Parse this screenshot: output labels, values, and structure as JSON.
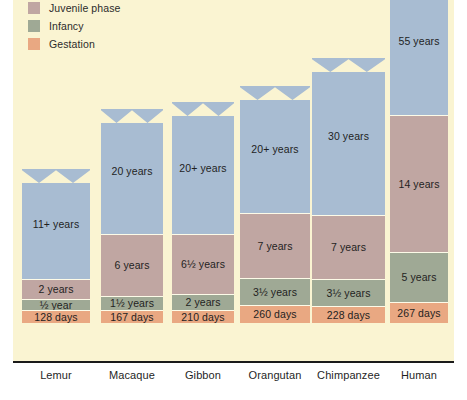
{
  "legend": {
    "items": [
      {
        "label": "Juvenile phase",
        "color": "#c0a6a2",
        "key": "juvenile"
      },
      {
        "label": "Infancy",
        "color": "#9fa995",
        "key": "infancy"
      },
      {
        "label": "Gestation",
        "color": "#e9a882",
        "key": "gestation"
      }
    ]
  },
  "colors": {
    "adult": "#a8bcd2",
    "juvenile": "#c0a6a2",
    "infancy": "#9fa995",
    "gestation": "#e9a882",
    "background": "#faf4d2",
    "axis": "#1a1a1a"
  },
  "chart_data": {
    "type": "bar",
    "title": "",
    "subtitle": "",
    "xlabel": "",
    "ylabel": "",
    "stacked": true,
    "grid": false,
    "legend_position": "top-left",
    "categories": [
      "Lemur",
      "Macaque",
      "Gibbon",
      "Orangutan",
      "Chimpanzee",
      "Human"
    ],
    "series": [
      {
        "name": "Gestation",
        "key": "gestation",
        "unit": "days",
        "values": [
          128,
          167,
          210,
          260,
          228,
          267
        ],
        "labels": [
          "128 days",
          "167 days",
          "210 days",
          "260 days",
          "228 days",
          "267 days"
        ]
      },
      {
        "name": "Infancy",
        "key": "infancy",
        "unit": "years",
        "values": [
          0.5,
          1.5,
          2,
          3.5,
          3.5,
          5
        ],
        "labels": [
          "½ year",
          "1½ years",
          "2 years",
          "3½ years",
          "3½ years",
          "5 years"
        ]
      },
      {
        "name": "Juvenile phase",
        "key": "juvenile",
        "unit": "years",
        "values": [
          2,
          6,
          6.5,
          7,
          7,
          14
        ],
        "labels": [
          "2 years",
          "6 years",
          "6½ years",
          "7 years",
          "7 years",
          "14 years"
        ]
      },
      {
        "name": "Adult phase",
        "key": "adult",
        "unit": "years",
        "values": [
          11,
          20,
          20,
          20,
          30,
          55
        ],
        "labels": [
          "11+ years",
          "20 years",
          "20+ years",
          "20+ years",
          "30 years",
          "55 years"
        ],
        "open_ended": [
          true,
          true,
          true,
          true,
          true,
          true
        ]
      }
    ]
  },
  "bars": [
    {
      "category": "Lemur",
      "segments": [
        {
          "key": "adult",
          "label": "11+ years",
          "jagged_top": true
        },
        {
          "key": "juvenile",
          "label": "2 years",
          "jagged_top": false
        },
        {
          "key": "infancy",
          "label": "½ year",
          "jagged_top": false
        },
        {
          "key": "gestation",
          "label": "128 days",
          "jagged_top": false
        }
      ]
    },
    {
      "category": "Macaque",
      "segments": [
        {
          "key": "adult",
          "label": "20 years",
          "jagged_top": true
        },
        {
          "key": "juvenile",
          "label": "6 years",
          "jagged_top": false
        },
        {
          "key": "infancy",
          "label": "1½ years",
          "jagged_top": false
        },
        {
          "key": "gestation",
          "label": "167 days",
          "jagged_top": false
        }
      ]
    },
    {
      "category": "Gibbon",
      "segments": [
        {
          "key": "adult",
          "label": "20+ years",
          "jagged_top": true
        },
        {
          "key": "juvenile",
          "label": "6½ years",
          "jagged_top": false
        },
        {
          "key": "infancy",
          "label": "2 years",
          "jagged_top": false
        },
        {
          "key": "gestation",
          "label": "210 days",
          "jagged_top": false
        }
      ]
    },
    {
      "category": "Orangutan",
      "segments": [
        {
          "key": "adult",
          "label": "20+ years",
          "jagged_top": true
        },
        {
          "key": "juvenile",
          "label": "7 years",
          "jagged_top": false
        },
        {
          "key": "infancy",
          "label": "3½ years",
          "jagged_top": false
        },
        {
          "key": "gestation",
          "label": "260 days",
          "jagged_top": false
        }
      ]
    },
    {
      "category": "Chimpanzee",
      "segments": [
        {
          "key": "adult",
          "label": "30 years",
          "jagged_top": true
        },
        {
          "key": "juvenile",
          "label": "7 years",
          "jagged_top": false
        },
        {
          "key": "infancy",
          "label": "3½ years",
          "jagged_top": false
        },
        {
          "key": "gestation",
          "label": "228 days",
          "jagged_top": false
        }
      ]
    },
    {
      "category": "Human",
      "segments": [
        {
          "key": "adult",
          "label": "55 years",
          "jagged_top": false
        },
        {
          "key": "juvenile",
          "label": "14 years",
          "jagged_top": false
        },
        {
          "key": "infancy",
          "label": "5 years",
          "jagged_top": false
        },
        {
          "key": "gestation",
          "label": "267 days",
          "jagged_top": false
        }
      ]
    }
  ],
  "layout": {
    "columns": [
      {
        "category": "Lemur",
        "x": 22,
        "width": 68,
        "label_x": 22,
        "label_w": 68
      },
      {
        "category": "Macaque",
        "x": 101,
        "width": 62,
        "label_x": 96,
        "label_w": 72
      },
      {
        "category": "Gibbon",
        "x": 172,
        "width": 62,
        "label_x": 167,
        "label_w": 72
      },
      {
        "category": "Orangutan",
        "x": 240,
        "width": 70,
        "label_x": 235,
        "label_w": 80
      },
      {
        "category": "Chimpanzee",
        "x": 312,
        "width": 73,
        "label_x": 307,
        "label_w": 83
      },
      {
        "category": "Human",
        "x": 390,
        "width": 58,
        "label_x": 383,
        "label_w": 72
      }
    ],
    "segment_heights": [
      {
        "category": "Lemur",
        "adult": 110,
        "juvenile": 20,
        "infancy": 11,
        "gestation": 13
      },
      {
        "category": "Macaque",
        "adult": 125,
        "juvenile": 62,
        "infancy": 14,
        "gestation": 13
      },
      {
        "category": "Gibbon",
        "adult": 132,
        "juvenile": 60,
        "infancy": 16,
        "gestation": 13
      },
      {
        "category": "Orangutan",
        "adult": 127,
        "juvenile": 65,
        "infancy": 27,
        "gestation": 18
      },
      {
        "category": "Chimpanzee",
        "adult": 157,
        "juvenile": 64,
        "infancy": 27,
        "gestation": 17
      },
      {
        "category": "Human",
        "adult": 148,
        "juvenile": 137,
        "infancy": 50,
        "gestation": 21
      }
    ]
  }
}
